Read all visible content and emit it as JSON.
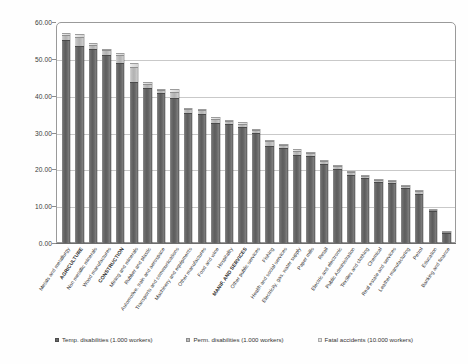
{
  "chart_data": {
    "type": "bar",
    "subtype": "stacked-vertical",
    "title": "",
    "xlabel": "",
    "ylabel": "",
    "ylim": [
      0,
      60
    ],
    "yticks": [
      "0.00",
      "10.00",
      "20.00",
      "30.00",
      "40.00",
      "50.00",
      "60.00"
    ],
    "ytick_values": [
      0,
      10,
      20,
      30,
      40,
      50,
      60
    ],
    "grid": true,
    "legend_position": "bottom",
    "categories": [
      "Metals and metallurgy",
      "AGRICULTURE",
      "Non metallic minerals",
      "Wood manufactures",
      "CONSTRUCTION",
      "Mining and minerals",
      "Rubber and plastic",
      "Automotive, train and aerospace",
      "Transports and communications",
      "Machinery and equipments",
      "Other manufactures",
      "Food and wine",
      "Hospitality",
      "MANIF. AND SERVICES",
      "Other public services",
      "Fishing",
      "Health and social services",
      "Electricity, gas, water supply",
      "Paper mills",
      "Retail",
      "Electric and electronic",
      "Public Administration",
      "Textiles and clothing",
      "Chemical",
      "Real estate and services",
      "Leather manufacturing",
      "Petrol",
      "Education",
      "Banking and finance"
    ],
    "emphasized_categories": [
      "AGRICULTURE",
      "CONSTRUCTION",
      "MANIF. AND SERVICES"
    ],
    "series": [
      {
        "name": "Temp. disabilities (1.000 workers)",
        "color": "#676767",
        "values": [
          55.2,
          53.6,
          52.6,
          51.0,
          48.9,
          43.7,
          42.2,
          40.7,
          39.5,
          35.3,
          35.1,
          32.7,
          32.3,
          31.4,
          29.8,
          26.3,
          25.9,
          23.9,
          23.7,
          21.5,
          20.0,
          18.5,
          17.6,
          16.6,
          16.2,
          14.9,
          13.4,
          8.6,
          2.7
        ]
      },
      {
        "name": "Perm. disabilities (1.000 workers)",
        "color": "#bdbdbd",
        "values": [
          1.3,
          2.2,
          1.2,
          1.3,
          2.1,
          4.2,
          1.0,
          0.8,
          1.6,
          1.0,
          0.9,
          1.0,
          0.7,
          1.0,
          0.9,
          1.3,
          0.7,
          1.1,
          0.8,
          0.8,
          0.8,
          0.7,
          0.7,
          0.6,
          0.6,
          0.6,
          0.6,
          0.4,
          0.3
        ]
      },
      {
        "name": "Fatal accidents (10.000 workers)",
        "color": "#e4e4e4",
        "values": [
          0.6,
          0.9,
          0.5,
          0.5,
          0.7,
          0.9,
          0.4,
          0.4,
          0.6,
          0.4,
          0.3,
          0.4,
          0.2,
          0.4,
          0.3,
          0.5,
          0.2,
          0.4,
          0.3,
          0.2,
          0.2,
          0.2,
          0.2,
          0.2,
          0.2,
          0.2,
          0.2,
          0.1,
          0.1
        ]
      }
    ]
  },
  "legend": {
    "items": [
      {
        "label": "Temp. disabilities (1.000 workers)",
        "swatch": "legend-swatch-temp"
      },
      {
        "label": "Perm. disabilities (1.000 workers)",
        "swatch": "legend-swatch-perm"
      },
      {
        "label": "Fatal accidents (10.000 workers)",
        "swatch": "legend-swatch-fatal"
      }
    ]
  }
}
